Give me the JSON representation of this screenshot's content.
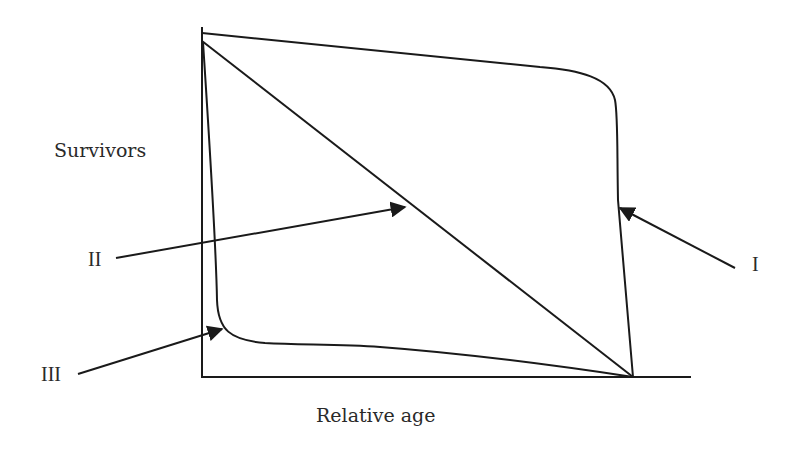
{
  "figure": {
    "y_axis_label": "Survivors",
    "x_axis_label": "Relative age",
    "curve_labels": {
      "type1": "I",
      "type2": "II",
      "type3": "III"
    }
  },
  "colors": {
    "line": "#1a1a1a",
    "text": "#2a2a2a",
    "background": "#ffffff"
  }
}
